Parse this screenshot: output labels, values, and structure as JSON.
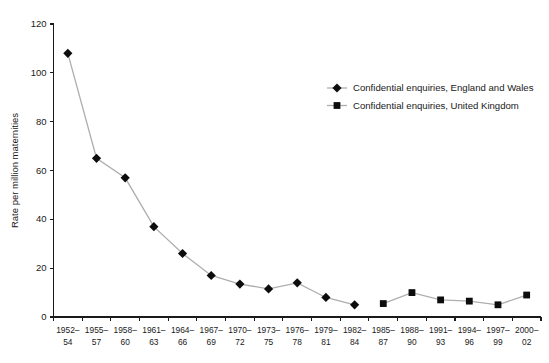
{
  "chart_data": {
    "type": "line",
    "title": "",
    "subtitle": "",
    "xlabel": "",
    "ylabel": "Rate per million maternities",
    "ylim": [
      0,
      120
    ],
    "ytick_values": [
      0,
      20,
      40,
      60,
      80,
      100,
      120
    ],
    "ytick_labels": [
      "0",
      "20",
      "40",
      "60",
      "80",
      "100",
      "120"
    ],
    "grid": false,
    "legend_position": "top-right",
    "categories": [
      "1952–54",
      "1955–57",
      "1958–60",
      "1961–63",
      "1964–66",
      "1967–69",
      "1970–72",
      "1973–75",
      "1976–78",
      "1979–81",
      "1982–84",
      "1985–87",
      "1988–90",
      "1991–93",
      "1994–96",
      "1997–99",
      "2000–02"
    ],
    "category_lines": [
      [
        "1952–",
        "54"
      ],
      [
        "1955–",
        "57"
      ],
      [
        "1958–",
        "60"
      ],
      [
        "1961–",
        "63"
      ],
      [
        "1964–",
        "66"
      ],
      [
        "1967–",
        "69"
      ],
      [
        "1970–",
        "72"
      ],
      [
        "1973–",
        "75"
      ],
      [
        "1976–",
        "78"
      ],
      [
        "1979–",
        "81"
      ],
      [
        "1982–",
        "84"
      ],
      [
        "1985–",
        "87"
      ],
      [
        "1988–",
        "90"
      ],
      [
        "1991–",
        "93"
      ],
      [
        "1994–",
        "96"
      ],
      [
        "1997–",
        "99"
      ],
      [
        "2000–",
        "02"
      ]
    ],
    "series": [
      {
        "name": "Confidential enquiries, England and Wales",
        "marker": "diamond",
        "marker_color": "#0d0d0d",
        "line_color": "#aeaeae",
        "values": [
          108,
          65,
          57,
          37,
          26,
          17,
          13.5,
          11.5,
          14,
          8,
          5,
          null,
          null,
          null,
          null,
          null,
          null
        ]
      },
      {
        "name": "Confidential enquiries, United Kingdom",
        "marker": "square",
        "marker_color": "#0d0d0d",
        "line_color": "#aeaeae",
        "values": [
          null,
          null,
          null,
          null,
          null,
          null,
          null,
          null,
          null,
          null,
          null,
          5.5,
          10,
          7,
          6.5,
          5,
          9
        ]
      }
    ]
  },
  "legend": {
    "items": [
      {
        "label": "Confidential enquiries, England and Wales",
        "marker": "diamond"
      },
      {
        "label": "Confidential enquiries, United Kingdom",
        "marker": "square"
      }
    ]
  }
}
